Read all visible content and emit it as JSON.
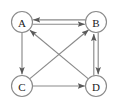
{
  "diagram": {
    "type": "directed-graph",
    "canvas": {
      "width": 118,
      "height": 108,
      "background": "#ffffff"
    },
    "style": {
      "stroke_color": "#8a8a8a",
      "label_color": "#1a1a1a",
      "node_fill": "#ffffff",
      "node_radius": 10.5,
      "stroke_width": 1.15,
      "parallel_edge_offset": 2.2
    },
    "nodes": [
      {
        "id": "A",
        "label": "A",
        "cx": 22,
        "cy": 22
      },
      {
        "id": "B",
        "label": "B",
        "cx": 96,
        "cy": 22
      },
      {
        "id": "C",
        "label": "C",
        "cx": 22,
        "cy": 86
      },
      {
        "id": "D",
        "label": "D",
        "cx": 96,
        "cy": 86
      }
    ],
    "edges": [
      {
        "id": "A-B",
        "from": "A",
        "to": "B",
        "kind": "parallel-horizontal",
        "direction": "right",
        "arrow_at": "B",
        "offset": 2.2
      },
      {
        "id": "B-A",
        "from": "B",
        "to": "A",
        "kind": "parallel-horizontal",
        "direction": "left",
        "arrow_at": "A",
        "offset": -2.2
      },
      {
        "id": "B-D",
        "from": "B",
        "to": "D",
        "kind": "parallel-vertical",
        "direction": "down",
        "arrow_at": "D",
        "offset": 2.2
      },
      {
        "id": "D-B",
        "from": "D",
        "to": "B",
        "kind": "parallel-vertical",
        "direction": "up",
        "arrow_at": "B",
        "offset": -2.2
      },
      {
        "id": "A-C",
        "from": "A",
        "to": "C",
        "kind": "straight-vertical",
        "direction": "down",
        "arrow_at": "C",
        "offset": 0
      },
      {
        "id": "C-D",
        "from": "C",
        "to": "D",
        "kind": "straight-horizontal",
        "direction": "right",
        "arrow_at": "D",
        "offset": 0
      },
      {
        "id": "C-B",
        "from": "C",
        "to": "B",
        "kind": "diagonal",
        "direction": "up-right",
        "arrow_at": "B",
        "offset": 0
      },
      {
        "id": "D-A",
        "from": "D",
        "to": "A",
        "kind": "diagonal",
        "direction": "up-left",
        "arrow_at": "A",
        "offset": 0
      }
    ],
    "edge_count": 8,
    "node_count": 4
  }
}
